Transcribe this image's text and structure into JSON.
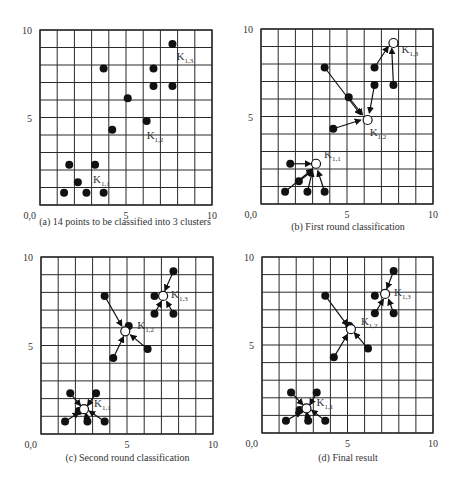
{
  "figure": {
    "axis": {
      "min": 0,
      "max": 10,
      "ticks": [
        "0,0",
        "5",
        "10"
      ],
      "ytick_labels": [
        "5",
        "10"
      ],
      "grid_step": 1
    },
    "colors": {
      "grid": "#2a2a2a",
      "point": "#111111",
      "centroid_fill": "#ffffff",
      "text": "#333333"
    }
  },
  "chart_data": [
    {
      "type": "scatter",
      "id": "a",
      "title": "(a) 14 points to be classified into 3 clusters",
      "xlim": [
        0,
        10
      ],
      "ylim": [
        0,
        10
      ],
      "grid": true,
      "points": [
        [
          1.4,
          0.7
        ],
        [
          2.2,
          1.3
        ],
        [
          2.7,
          0.7
        ],
        [
          3.7,
          0.7
        ],
        [
          1.7,
          2.3
        ],
        [
          3.2,
          2.3
        ],
        [
          3.7,
          7.8
        ],
        [
          4.2,
          4.3
        ],
        [
          5.1,
          6.1
        ],
        [
          6.2,
          4.8
        ],
        [
          6.6,
          7.8
        ],
        [
          6.6,
          6.8
        ],
        [
          7.7,
          6.8
        ],
        [
          7.7,
          9.2
        ]
      ],
      "centroids": [],
      "labels": [
        {
          "text": "K",
          "sub": "1,1",
          "at": [
            3.2,
            2.3
          ],
          "dx": -2,
          "dy": 18
        },
        {
          "text": "K",
          "sub": "1,2",
          "at": [
            6.2,
            4.8
          ],
          "dx": 0,
          "dy": 18
        },
        {
          "text": "K",
          "sub": "1,3",
          "at": [
            7.7,
            9.2
          ],
          "dx": 4,
          "dy": 16
        }
      ],
      "arrows": []
    },
    {
      "type": "scatter",
      "id": "b",
      "title": "(b) First round classification",
      "xlim": [
        0,
        10
      ],
      "ylim": [
        0,
        10
      ],
      "grid": true,
      "points": [
        [
          1.4,
          0.7
        ],
        [
          2.2,
          1.3
        ],
        [
          2.7,
          0.7
        ],
        [
          3.7,
          0.7
        ],
        [
          1.7,
          2.3
        ],
        [
          3.7,
          7.8
        ],
        [
          4.2,
          4.3
        ],
        [
          5.1,
          6.1
        ],
        [
          6.6,
          7.8
        ],
        [
          6.6,
          6.8
        ],
        [
          7.7,
          6.8
        ]
      ],
      "centroids": [
        [
          3.2,
          2.3
        ],
        [
          6.2,
          4.8
        ],
        [
          7.7,
          9.2
        ]
      ],
      "labels": [
        {
          "text": "K",
          "sub": "1,1",
          "at": [
            3.2,
            2.3
          ],
          "dx": 8,
          "dy": -6
        },
        {
          "text": "K",
          "sub": "1,2",
          "at": [
            6.2,
            4.8
          ],
          "dx": 2,
          "dy": 16
        },
        {
          "text": "K",
          "sub": "1,3",
          "at": [
            7.7,
            9.2
          ],
          "dx": 8,
          "dy": 10
        }
      ],
      "arrows": [
        [
          [
            1.4,
            0.7
          ],
          [
            3.0,
            2.0
          ]
        ],
        [
          [
            2.2,
            1.3
          ],
          [
            3.0,
            1.9
          ]
        ],
        [
          [
            2.7,
            0.7
          ],
          [
            3.0,
            1.9
          ]
        ],
        [
          [
            3.7,
            0.7
          ],
          [
            3.3,
            1.9
          ]
        ],
        [
          [
            1.7,
            2.3
          ],
          [
            2.9,
            2.3
          ]
        ],
        [
          [
            3.7,
            7.8
          ],
          [
            5.8,
            5.1
          ]
        ],
        [
          [
            5.1,
            6.1
          ],
          [
            5.9,
            5.1
          ]
        ],
        [
          [
            6.6,
            6.8
          ],
          [
            6.3,
            5.2
          ]
        ],
        [
          [
            4.2,
            4.3
          ],
          [
            5.8,
            4.8
          ]
        ],
        [
          [
            6.6,
            7.8
          ],
          [
            7.4,
            9.0
          ]
        ],
        [
          [
            7.7,
            6.8
          ],
          [
            7.6,
            8.9
          ]
        ]
      ]
    },
    {
      "type": "scatter",
      "id": "c",
      "title": "(c) Second round classification",
      "xlim": [
        0,
        10
      ],
      "ylim": [
        0,
        10
      ],
      "grid": true,
      "points": [
        [
          1.4,
          0.7
        ],
        [
          2.2,
          1.3
        ],
        [
          2.7,
          0.7
        ],
        [
          3.7,
          0.7
        ],
        [
          1.7,
          2.3
        ],
        [
          3.2,
          2.3
        ],
        [
          3.7,
          7.8
        ],
        [
          4.2,
          4.3
        ],
        [
          5.1,
          6.1
        ],
        [
          6.2,
          4.8
        ],
        [
          6.6,
          7.8
        ],
        [
          6.6,
          6.8
        ],
        [
          7.7,
          6.8
        ],
        [
          7.7,
          9.2
        ]
      ],
      "centroids": [
        [
          2.5,
          1.4
        ],
        [
          4.9,
          5.8
        ],
        [
          7.1,
          7.8
        ]
      ],
      "labels": [
        {
          "text": "K",
          "sub": "1,1",
          "at": [
            2.5,
            1.4
          ],
          "dx": 10,
          "dy": -2
        },
        {
          "text": "K",
          "sub": "1,2",
          "at": [
            4.9,
            5.8
          ],
          "dx": 12,
          "dy": -2
        },
        {
          "text": "K",
          "sub": "1,3",
          "at": [
            7.1,
            7.8
          ],
          "dx": 8,
          "dy": 2
        }
      ],
      "arrows": [
        [
          [
            1.4,
            0.7
          ],
          [
            2.2,
            1.2
          ]
        ],
        [
          [
            2.7,
            0.7
          ],
          [
            2.6,
            1.2
          ]
        ],
        [
          [
            3.7,
            0.7
          ],
          [
            2.8,
            1.3
          ]
        ],
        [
          [
            1.7,
            2.3
          ],
          [
            2.3,
            1.6
          ]
        ],
        [
          [
            3.2,
            2.3
          ],
          [
            2.7,
            1.6
          ]
        ],
        [
          [
            3.7,
            7.8
          ],
          [
            4.7,
            6.1
          ]
        ],
        [
          [
            4.2,
            4.3
          ],
          [
            4.8,
            5.5
          ]
        ],
        [
          [
            6.2,
            4.8
          ],
          [
            5.2,
            5.6
          ]
        ],
        [
          [
            7.7,
            9.2
          ],
          [
            7.2,
            8.1
          ]
        ],
        [
          [
            6.6,
            6.8
          ],
          [
            7.0,
            7.5
          ]
        ],
        [
          [
            7.7,
            6.8
          ],
          [
            7.3,
            7.5
          ]
        ]
      ]
    },
    {
      "type": "scatter",
      "id": "d",
      "title": "(d) Final result",
      "xlim": [
        0,
        10
      ],
      "ylim": [
        0,
        10
      ],
      "grid": true,
      "points": [
        [
          1.4,
          0.7
        ],
        [
          2.2,
          1.3
        ],
        [
          2.7,
          0.7
        ],
        [
          3.7,
          0.7
        ],
        [
          1.7,
          2.3
        ],
        [
          3.2,
          2.3
        ],
        [
          3.7,
          7.8
        ],
        [
          4.2,
          4.3
        ],
        [
          5.1,
          6.1
        ],
        [
          6.2,
          4.8
        ],
        [
          6.6,
          7.8
        ],
        [
          6.6,
          6.8
        ],
        [
          7.7,
          6.8
        ],
        [
          7.7,
          9.2
        ]
      ],
      "centroids": [
        [
          2.6,
          1.4
        ],
        [
          5.2,
          5.9
        ],
        [
          7.2,
          7.9
        ]
      ],
      "labels": [
        {
          "text": "K",
          "sub": "1,1",
          "at": [
            2.6,
            1.4
          ],
          "dx": 10,
          "dy": -2
        },
        {
          "text": "K",
          "sub": "1,2",
          "at": [
            5.2,
            5.9
          ],
          "dx": 10,
          "dy": -4
        },
        {
          "text": "K",
          "sub": "1,3",
          "at": [
            7.2,
            7.9
          ],
          "dx": 9,
          "dy": 2
        }
      ],
      "arrows": [
        [
          [
            1.4,
            0.7
          ],
          [
            2.3,
            1.2
          ]
        ],
        [
          [
            2.7,
            0.7
          ],
          [
            2.6,
            1.2
          ]
        ],
        [
          [
            3.7,
            0.7
          ],
          [
            2.9,
            1.3
          ]
        ],
        [
          [
            1.7,
            2.3
          ],
          [
            2.4,
            1.6
          ]
        ],
        [
          [
            3.2,
            2.3
          ],
          [
            2.8,
            1.6
          ]
        ],
        [
          [
            3.7,
            7.8
          ],
          [
            5.0,
            6.1
          ]
        ],
        [
          [
            4.2,
            4.3
          ],
          [
            5.0,
            5.6
          ]
        ],
        [
          [
            6.2,
            4.8
          ],
          [
            5.4,
            5.7
          ]
        ],
        [
          [
            7.7,
            9.2
          ],
          [
            7.3,
            8.2
          ]
        ],
        [
          [
            6.6,
            6.8
          ],
          [
            7.1,
            7.6
          ]
        ],
        [
          [
            7.7,
            6.8
          ],
          [
            7.4,
            7.6
          ]
        ]
      ]
    }
  ]
}
